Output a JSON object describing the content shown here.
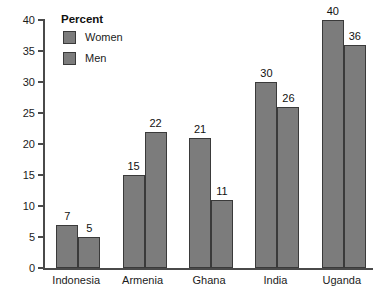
{
  "chart_data": {
    "type": "bar",
    "title": "",
    "subtitle": "",
    "xlabel": "",
    "ylabel": "",
    "ylim": [
      0,
      40
    ],
    "ytick_step": 5,
    "yticks": [
      "0",
      "5",
      "10",
      "15",
      "20",
      "25",
      "30",
      "35",
      "40"
    ],
    "grid": false,
    "legend_position": "top-left-inside",
    "legend_title": "Percent",
    "categories": [
      "Indonesia",
      "Armenia",
      "Ghana",
      "India",
      "Uganda"
    ],
    "series": [
      {
        "name": "Women",
        "color": "#7c7c7c",
        "values": [
          7,
          15,
          21,
          30,
          40
        ],
        "labels": [
          "7",
          "15",
          "21",
          "30",
          "40"
        ]
      },
      {
        "name": "Men",
        "color": "#7c7c7c",
        "values": [
          5,
          22,
          11,
          26,
          36
        ],
        "labels": [
          "5",
          "22",
          "11",
          "26",
          "36"
        ]
      }
    ]
  },
  "colors": {
    "bar_fill": "#7c7c7c",
    "bar_stroke": "#3a3a3a",
    "axis": "#4a4a4a",
    "text": "#1b1b1b",
    "background": "#ffffff"
  }
}
